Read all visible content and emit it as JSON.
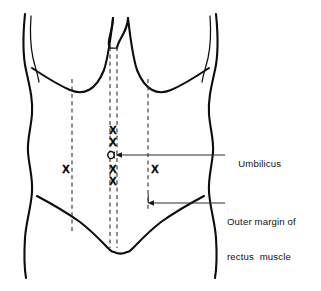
{
  "figure": {
    "background_color": "#ffffff",
    "ink_color": "#0d0d0d",
    "dash_color": "#3a3a3a",
    "width": 321,
    "height": 291
  },
  "labels": {
    "umbilicus": {
      "text": "Umbilicus",
      "lines": [
        "Umbilicus"
      ]
    },
    "rectus_margin": {
      "text": "Outer margin of rectus muscle",
      "lines": [
        "Outer margin of",
        "rectus  muscle"
      ],
      "line1": "Outer margin of",
      "line2": "rectus  muscle"
    }
  },
  "markers": {
    "x_symbol": "X",
    "midline_x_marks": [
      {
        "id": "midline-x-1",
        "label": "X",
        "x": 113,
        "y": 131
      },
      {
        "id": "midline-x-2",
        "label": "X",
        "x": 113,
        "y": 143
      },
      {
        "id": "midline-x-3",
        "label": "X",
        "x": 113,
        "y": 170
      },
      {
        "id": "midline-x-4",
        "label": "X",
        "x": 113,
        "y": 182
      }
    ],
    "lateral_x_marks": [
      {
        "id": "left-lateral-x",
        "label": "X",
        "x": 66,
        "y": 170
      },
      {
        "id": "right-lateral-x",
        "label": "X",
        "x": 155,
        "y": 170
      }
    ],
    "umbilicus_marker": {
      "id": "umbilicus-ring",
      "cx": 111,
      "cy": 155,
      "rx": 3.2,
      "ry": 3.6
    }
  },
  "guide_lines": {
    "left_rectus_border": {
      "x": 72,
      "y_top": 79,
      "y_bottom": 232
    },
    "midline_left": {
      "x": 110,
      "y_top": 47,
      "y_bottom": 248
    },
    "midline_right": {
      "x": 117,
      "y_top": 47,
      "y_bottom": 248
    },
    "right_rectus_border": {
      "x": 148,
      "y_top": 79,
      "y_bottom": 212
    }
  },
  "leaders": {
    "umbilicus_leader": {
      "from_x": 118,
      "from_y": 155,
      "to_x": 225,
      "to_y": 155
    },
    "rectus_leader": {
      "from_x": 148,
      "from_y": 203,
      "to_x": 225,
      "to_y": 203
    }
  }
}
